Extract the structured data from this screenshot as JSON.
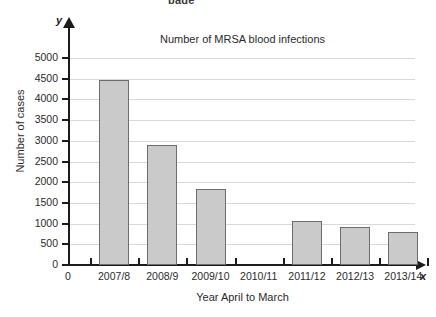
{
  "page": {
    "top_cropped_text": "page"
  },
  "axis_markers": {
    "y_letter": "y",
    "x_letter": "x",
    "origin_label": "0"
  },
  "chart_data": {
    "type": "bar",
    "title": "Number of MRSA blood infections",
    "xlabel": "Year April to March",
    "ylabel": "Number of cases",
    "categories": [
      "2007/8",
      "2008/9",
      "2009/10",
      "2010/11",
      "2011/12",
      "2012/13",
      "2013/14"
    ],
    "values": [
      4470,
      2900,
      1840,
      null,
      1060,
      920,
      790
    ],
    "ylim": [
      0,
      5000
    ],
    "ytick_labels": [
      "0",
      "500",
      "1000",
      "1500",
      "2000",
      "2500",
      "3000",
      "3500",
      "4000",
      "4500",
      "5000"
    ],
    "ytick_values": [
      0,
      500,
      1000,
      1500,
      2000,
      2500,
      3000,
      3500,
      4000,
      4500,
      5000
    ],
    "grid": true,
    "legend": null,
    "bar_fill_color": "#cacaca",
    "bar_edge_color": "#6d6d6d",
    "grid_color": "#d9d9d9",
    "axis_color": "#1b1b1b"
  }
}
